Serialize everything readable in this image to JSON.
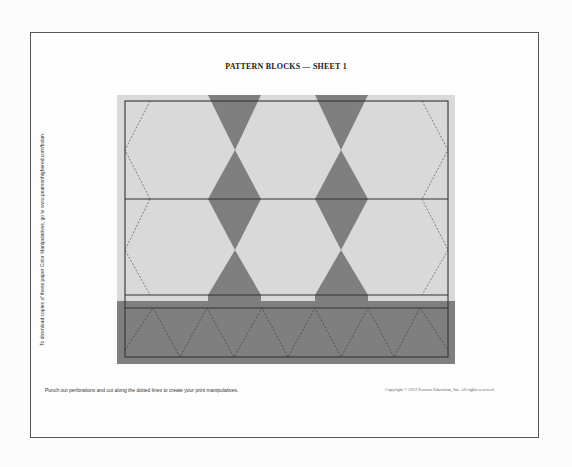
{
  "document": {
    "title": "PATTERN BLOCKS — SHEET 1",
    "side_note": "To download copies of these paper Color Manipulatives, go to www.pearsonhighered.com/bolan",
    "footer_instructions": "Punch out perforations and cut along the dotted lines to create your print manipulatives.",
    "copyright": "Copyright © 2012 Pearson Education, Inc. All rights reserved."
  },
  "pattern": {
    "shapes": [
      {
        "type": "hexagon",
        "count": 6,
        "color": "#d9d9d9"
      },
      {
        "type": "trapezoid",
        "count": 8,
        "color": "#7f7f7f"
      },
      {
        "type": "triangle",
        "count": 11,
        "color": "#7f7f7f"
      }
    ],
    "colors": {
      "page_background": "#fdfdfd",
      "hexagon_fill": "#d9d9d9",
      "dark_fill": "#7f7f7f",
      "frame_line": "#333333",
      "dashed_line": "#555555"
    }
  }
}
